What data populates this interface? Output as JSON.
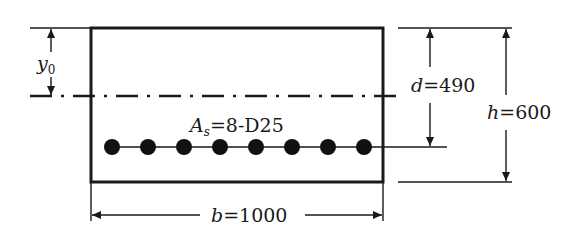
{
  "diagram": {
    "colors": {
      "stroke": "#1a1a1a",
      "background": "#ffffff"
    },
    "section": {
      "x": 91,
      "y": 28,
      "width": 292,
      "height": 154
    },
    "neutral_axis": {
      "y": 96,
      "x_start": 30,
      "x_end": 397,
      "style": "dash-dot"
    },
    "rebar": {
      "count": 8,
      "y": 147,
      "radius": 8,
      "x_positions": [
        112,
        148,
        184,
        220,
        256,
        292,
        328,
        364
      ],
      "line_x_end": 447
    },
    "labels": {
      "y0": {
        "var": "y",
        "sub": "0"
      },
      "as": {
        "var": "A",
        "sub": "s",
        "value": "=8-D25"
      },
      "d": {
        "var": "d",
        "value": "=490"
      },
      "h": {
        "var": "h",
        "value": "=600"
      },
      "b": {
        "var": "b",
        "value": "=1000"
      }
    },
    "dimensions": {
      "y0": {
        "x": 51,
        "from_y": 28,
        "to_y": 96
      },
      "d": {
        "x": 430,
        "from_y": 28,
        "to_y": 147
      },
      "h": {
        "x": 506,
        "from_y": 28,
        "to_y": 182
      },
      "b": {
        "y": 215,
        "from_x": 91,
        "to_x": 383
      }
    }
  }
}
